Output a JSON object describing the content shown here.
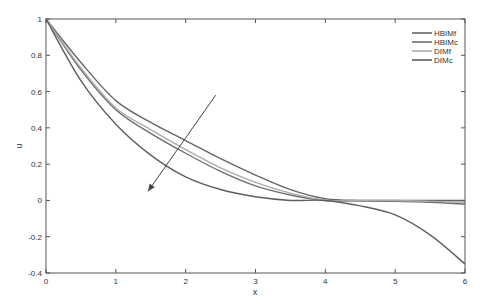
{
  "chart_data": {
    "type": "line",
    "title": "",
    "xlabel": "x",
    "ylabel": "u",
    "xlim": [
      0,
      6
    ],
    "ylim": [
      -0.4,
      1
    ],
    "xticks": [
      0,
      1,
      2,
      3,
      4,
      5,
      6
    ],
    "xtick_labels": [
      "0",
      "1",
      "2",
      "3",
      "4",
      "5",
      "6"
    ],
    "yticks": [
      -0.4,
      -0.2,
      0,
      0.2,
      0.4,
      0.6,
      0.8,
      1
    ],
    "ytick_labels": [
      "-0.4",
      "-0.2",
      "0",
      "0.2",
      "0.4",
      "0.6",
      "0.8",
      "1"
    ],
    "grid": false,
    "legend_position": "upper right",
    "x": [
      0,
      0.5,
      1,
      1.5,
      2,
      2.5,
      3,
      3.5,
      4,
      4.5,
      5,
      5.5,
      6
    ],
    "series": [
      {
        "name": "HBIMf",
        "color": "#666666",
        "values": [
          1,
          0.76,
          0.55,
          0.43,
          0.33,
          0.23,
          0.14,
          0.06,
          0.01,
          0.0,
          0.0,
          0.0,
          0.0
        ]
      },
      {
        "name": "HBIMc",
        "color": "#6e6e6e",
        "values": [
          1,
          0.72,
          0.5,
          0.37,
          0.26,
          0.16,
          0.08,
          0.03,
          0.0,
          -0.003,
          -0.005,
          -0.01,
          -0.02
        ]
      },
      {
        "name": "DIMf",
        "color": "#ababab",
        "values": [
          1,
          0.73,
          0.51,
          0.39,
          0.28,
          0.18,
          0.1,
          0.04,
          0.0,
          0.0,
          0.0,
          -0.005,
          -0.01
        ]
      },
      {
        "name": "DIMc",
        "color": "#5e5e5e",
        "values": [
          1,
          0.66,
          0.42,
          0.25,
          0.13,
          0.06,
          0.02,
          0.0,
          0.0,
          -0.03,
          -0.08,
          -0.19,
          -0.35
        ]
      }
    ],
    "annotations": [
      {
        "type": "arrow",
        "from": [
          2.43,
          0.58
        ],
        "to": [
          1.46,
          0.05
        ],
        "meaning": "trend direction"
      }
    ]
  }
}
